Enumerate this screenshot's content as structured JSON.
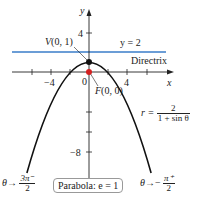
{
  "figure": {
    "axes": {
      "x_label": "x",
      "y_label": "y",
      "tick_labels": {
        "x_neg": "−4",
        "x_zero": "0",
        "x_pos": "4",
        "y_pos": "4",
        "y_neg": "−8"
      }
    },
    "directrix": {
      "equation": "y = 2",
      "label": "Directrix",
      "color": "#3a7dc9"
    },
    "vertex": {
      "label": "V(0, 1)",
      "color": "#111111"
    },
    "focus": {
      "label": "F(0, 0)",
      "color": "#d42020"
    },
    "equation": {
      "lhs": "r =",
      "numerator": "2",
      "denominator": "1 + sin θ"
    },
    "left_limit": {
      "theta": "θ",
      "arrow": "→",
      "numerator": "3π⁻",
      "denominator": "2"
    },
    "right_limit": {
      "theta": "θ",
      "arrow": "→",
      "sign": "−",
      "numerator": "π⁺",
      "denominator": "2"
    },
    "caption": "Parabola: e = 1"
  }
}
